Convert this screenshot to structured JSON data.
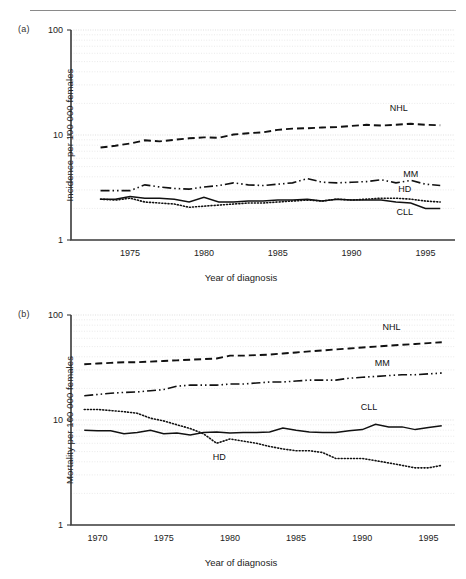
{
  "figure": {
    "panels": [
      {
        "tag": "(a)",
        "id": "a"
      },
      {
        "tag": "(b)",
        "id": "b"
      }
    ]
  },
  "chart_data": [
    {
      "type": "line",
      "panel": "(a)",
      "title": "",
      "xlabel": "Year of diagnosis",
      "ylabel": "Incidence per 100 000 females",
      "yscale": "log",
      "ylim": [
        1,
        100
      ],
      "yticks": [
        1,
        10,
        100
      ],
      "ytick_labels": [
        "1",
        "10",
        "100"
      ],
      "xlim": [
        1971,
        1997
      ],
      "xticks": [
        1975,
        1980,
        1985,
        1990,
        1995
      ],
      "xtick_labels": [
        "1975",
        "1980",
        "1985",
        "1990",
        "1995"
      ],
      "grid": true,
      "legend": "inline-series-labels",
      "series": [
        {
          "name": "NHL",
          "style": "dashed",
          "label_x": 1993.2,
          "label_y": 17.0,
          "x": [
            1973,
            1974,
            1975,
            1976,
            1977,
            1978,
            1979,
            1980,
            1981,
            1982,
            1983,
            1984,
            1985,
            1986,
            1987,
            1988,
            1989,
            1990,
            1991,
            1992,
            1993,
            1994,
            1995,
            1996
          ],
          "values": [
            7.6,
            7.9,
            8.3,
            8.9,
            8.7,
            9.0,
            9.3,
            9.5,
            9.4,
            10.1,
            10.4,
            10.6,
            11.2,
            11.5,
            11.6,
            11.8,
            11.9,
            12.2,
            12.5,
            12.3,
            12.5,
            12.8,
            12.5,
            12.4
          ]
        },
        {
          "name": "MM",
          "style": "dash-dot",
          "label_x": 1994.0,
          "label_y": 4.0,
          "x": [
            1973,
            1974,
            1975,
            1976,
            1977,
            1978,
            1979,
            1980,
            1981,
            1982,
            1983,
            1984,
            1985,
            1986,
            1987,
            1988,
            1989,
            1990,
            1991,
            1992,
            1993,
            1994,
            1995,
            1996
          ],
          "values": [
            2.95,
            2.95,
            2.95,
            3.35,
            3.2,
            3.1,
            3.05,
            3.2,
            3.3,
            3.5,
            3.35,
            3.3,
            3.4,
            3.5,
            3.85,
            3.55,
            3.5,
            3.55,
            3.6,
            3.75,
            3.5,
            3.7,
            3.4,
            3.3
          ]
        },
        {
          "name": "HD",
          "style": "dotted",
          "label_x": 1993.6,
          "label_y": 2.85,
          "x": [
            1973,
            1974,
            1975,
            1976,
            1977,
            1978,
            1979,
            1980,
            1981,
            1982,
            1983,
            1984,
            1985,
            1986,
            1987,
            1988,
            1989,
            1990,
            1991,
            1992,
            1993,
            1994,
            1995,
            1996
          ],
          "values": [
            2.45,
            2.4,
            2.5,
            2.3,
            2.25,
            2.2,
            2.05,
            2.1,
            2.15,
            2.2,
            2.25,
            2.25,
            2.3,
            2.35,
            2.4,
            2.35,
            2.45,
            2.4,
            2.45,
            2.5,
            2.5,
            2.45,
            2.35,
            2.3
          ]
        },
        {
          "name": "CLL",
          "style": "solid",
          "label_x": 1993.6,
          "label_y": 1.72,
          "x": [
            1973,
            1974,
            1975,
            1976,
            1977,
            1978,
            1979,
            1980,
            1981,
            1982,
            1983,
            1984,
            1985,
            1986,
            1987,
            1988,
            1989,
            1990,
            1991,
            1992,
            1993,
            1994,
            1995,
            1996
          ],
          "values": [
            2.45,
            2.45,
            2.6,
            2.5,
            2.5,
            2.45,
            2.3,
            2.55,
            2.3,
            2.3,
            2.35,
            2.35,
            2.4,
            2.4,
            2.45,
            2.35,
            2.45,
            2.4,
            2.4,
            2.4,
            2.3,
            2.25,
            2.0,
            2.0
          ]
        }
      ]
    },
    {
      "type": "line",
      "panel": "(b)",
      "title": "",
      "xlabel": "Year of diagnosis",
      "ylabel": "Mortality per 100 000 females",
      "yscale": "log",
      "ylim": [
        1,
        100
      ],
      "yticks": [
        1,
        10,
        100
      ],
      "ytick_labels": [
        "1",
        "10",
        "100"
      ],
      "xlim": [
        1968,
        1997
      ],
      "xticks": [
        1970,
        1975,
        1980,
        1985,
        1990,
        1995
      ],
      "xtick_labels": [
        "1970",
        "1975",
        "1980",
        "1985",
        "1990",
        "1995"
      ],
      "grid": true,
      "legend": "inline-series-labels",
      "series": [
        {
          "name": "NHL",
          "style": "dashed",
          "label_x": 1992.2,
          "label_y": 72.0,
          "x": [
            1969,
            1970,
            1971,
            1972,
            1973,
            1974,
            1975,
            1976,
            1977,
            1978,
            1979,
            1980,
            1981,
            1982,
            1983,
            1984,
            1985,
            1986,
            1987,
            1988,
            1989,
            1990,
            1991,
            1992,
            1993,
            1994,
            1995,
            1996
          ],
          "values": [
            34,
            34.5,
            35,
            35.5,
            35.5,
            36,
            36.5,
            37,
            37.5,
            38,
            38.5,
            41,
            41,
            41.5,
            42,
            43,
            44,
            45,
            46,
            47,
            48,
            49,
            50,
            51,
            52,
            53,
            54,
            55
          ]
        },
        {
          "name": "MM",
          "style": "dash-dot",
          "label_x": 1991.5,
          "label_y": 33.0,
          "x": [
            1969,
            1970,
            1971,
            1972,
            1973,
            1974,
            1975,
            1976,
            1977,
            1978,
            1979,
            1980,
            1981,
            1982,
            1983,
            1984,
            1985,
            1986,
            1987,
            1988,
            1989,
            1990,
            1991,
            1992,
            1993,
            1994,
            1995,
            1996
          ],
          "values": [
            17,
            17.5,
            18,
            18.3,
            18.5,
            19,
            19.5,
            21,
            21.5,
            21.5,
            21.5,
            22,
            22,
            22.5,
            23,
            23,
            23.5,
            24,
            24,
            24,
            25,
            25.5,
            26,
            26.5,
            27,
            27,
            27.5,
            28
          ]
        },
        {
          "name": "CLL",
          "style": "solid",
          "label_x": 1990.5,
          "label_y": 12.5,
          "x": [
            1969,
            1970,
            1971,
            1972,
            1973,
            1974,
            1975,
            1976,
            1977,
            1978,
            1979,
            1980,
            1981,
            1982,
            1983,
            1984,
            1985,
            1986,
            1987,
            1988,
            1989,
            1990,
            1991,
            1992,
            1993,
            1994,
            1995,
            1996
          ],
          "values": [
            8.0,
            7.9,
            7.9,
            7.4,
            7.6,
            8.0,
            7.4,
            7.5,
            7.2,
            7.6,
            7.7,
            7.5,
            7.6,
            7.6,
            7.7,
            8.4,
            8.0,
            7.7,
            7.6,
            7.6,
            7.9,
            8.1,
            9.1,
            8.6,
            8.6,
            8.1,
            8.5,
            8.8
          ]
        },
        {
          "name": "HD",
          "style": "dotted",
          "label_x": 1979.2,
          "label_y": 4.15,
          "x": [
            1969,
            1970,
            1971,
            1972,
            1973,
            1974,
            1975,
            1976,
            1977,
            1978,
            1979,
            1980,
            1981,
            1982,
            1983,
            1984,
            1985,
            1986,
            1987,
            1988,
            1989,
            1990,
            1991,
            1992,
            1993,
            1994,
            1995,
            1996
          ],
          "values": [
            12.6,
            12.6,
            12.3,
            12.0,
            11.6,
            10.4,
            9.8,
            9.0,
            8.3,
            7.4,
            6.0,
            6.6,
            6.3,
            6.0,
            5.6,
            5.3,
            5.1,
            5.1,
            4.9,
            4.3,
            4.3,
            4.3,
            4.1,
            3.9,
            3.7,
            3.5,
            3.5,
            3.7
          ]
        }
      ]
    }
  ]
}
